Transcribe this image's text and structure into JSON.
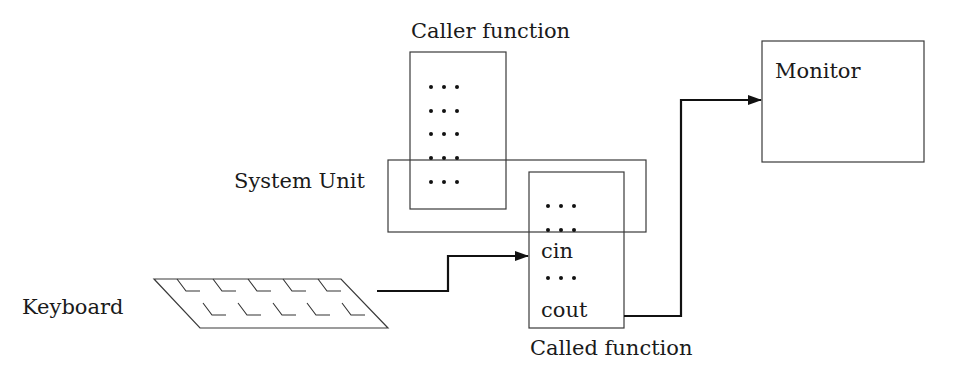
{
  "diagram": {
    "type": "block-diagram",
    "labels": {
      "caller_function": "Caller function",
      "system_unit": "System Unit",
      "called_function": "Called function",
      "monitor": "Monitor",
      "keyboard": "Keyboard"
    },
    "called_function_lines": {
      "line1": "• • •",
      "line2": "• • •",
      "line3": "cin",
      "line4": "• • •",
      "line5": "cout"
    },
    "caller_function_lines": [
      "• • •",
      "• • •",
      "• • •",
      "• • •",
      "• • •"
    ],
    "edges": [
      {
        "from": "Keyboard",
        "to": "Called function (cin)",
        "directed": true
      },
      {
        "from": "Called function (cout)",
        "to": "Monitor",
        "directed": true
      }
    ],
    "colors": {
      "stroke": "#3a3a3a",
      "text": "#1a1a1a",
      "background": "#ffffff"
    }
  }
}
